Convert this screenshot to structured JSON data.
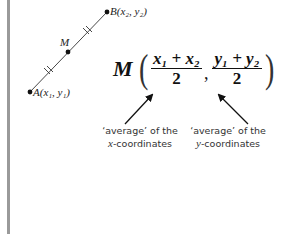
{
  "diagram": {
    "points": [
      {
        "id": "A",
        "label": "A(x₁, y₁)",
        "x": 30,
        "y": 92
      },
      {
        "id": "M",
        "label": "M",
        "x": 68,
        "y": 52
      },
      {
        "id": "B",
        "label": "B(x₂, y₂)",
        "x": 107,
        "y": 12
      }
    ],
    "segment": {
      "from": "A",
      "to": "B",
      "equal_marks": "double tick on AM and MB"
    },
    "formula": {
      "point": "M",
      "x_numerator": "x₁ + x₂",
      "y_numerator": "y₁ + y₂",
      "denominator": "2",
      "text": "M((x₁ + x₂)/2, (y₁ + y₂)/2)"
    },
    "annotations": [
      {
        "line1": "‘average’ of the",
        "line2_var": "x",
        "line2_rest": "-coordinates"
      },
      {
        "line1": "‘average’ of the",
        "line2_var": "y",
        "line2_rest": "-coordinates"
      }
    ],
    "colors": {
      "ink": "#111111",
      "side_bar": "#9a9a9a",
      "background": "#ffffff"
    }
  }
}
